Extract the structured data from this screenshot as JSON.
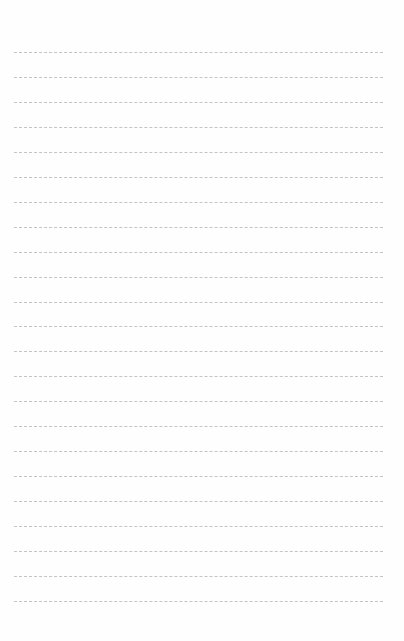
{
  "page": {
    "type": "lined-paper",
    "line_count": 23,
    "first_line_y": 52,
    "line_spacing": 24.95,
    "line_color": "#c4c4c4",
    "background": "#fefefe"
  }
}
